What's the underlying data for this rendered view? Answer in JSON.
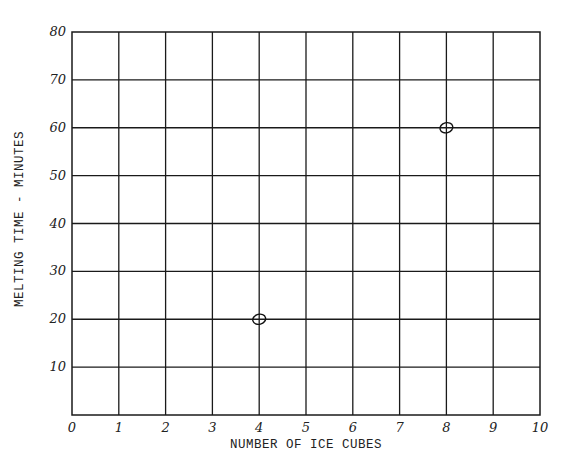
{
  "chart_data": {
    "type": "scatter",
    "title": "",
    "xlabel": "NUMBER OF ICE CUBES",
    "ylabel": "MELTING TIME - MINUTES",
    "xlim": [
      0,
      10
    ],
    "ylim": [
      0,
      80
    ],
    "grid": true,
    "x_ticks": [
      "0",
      "1",
      "2",
      "3",
      "4",
      "5",
      "6",
      "7",
      "8",
      "9",
      "10"
    ],
    "y_ticks": [
      "10",
      "20",
      "30",
      "40",
      "50",
      "60",
      "70",
      "80"
    ],
    "series": [
      {
        "name": "Melting time",
        "marker": "open-circle",
        "points": [
          {
            "x": 4,
            "y": 20
          },
          {
            "x": 8,
            "y": 60
          }
        ]
      }
    ],
    "legend": null
  }
}
